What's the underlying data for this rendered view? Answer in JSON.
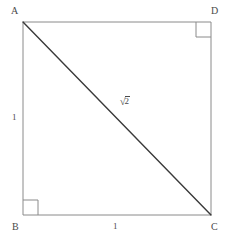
{
  "figure": {
    "kind": "geometry-diagram",
    "canvas": {
      "width": 233,
      "height": 239
    },
    "colors": {
      "background": "#ffffff",
      "square_stroke": "#8a8a8a",
      "diagonal_stroke": "#3a3a3a",
      "right_angle_stroke": "#8a8a8a",
      "label_text": "#4a4a4a"
    },
    "square": {
      "stroke_width": 1,
      "corners": {
        "top_left": {
          "x": 23,
          "y": 22
        },
        "top_right": {
          "x": 211,
          "y": 22
        },
        "bottom_right": {
          "x": 211,
          "y": 215
        },
        "bottom_left": {
          "x": 23,
          "y": 215
        }
      }
    },
    "diagonal": {
      "stroke_width": 1.4,
      "from": {
        "x": 23,
        "y": 22
      },
      "to": {
        "x": 211,
        "y": 215
      }
    },
    "right_angle_markers": [
      {
        "at": "D",
        "x": 196,
        "y": 22,
        "size": 15
      },
      {
        "at": "B",
        "x": 23,
        "y": 200,
        "size": 15
      }
    ],
    "vertex_labels": [
      {
        "id": "A",
        "text": "A"
      },
      {
        "id": "D",
        "text": "D"
      },
      {
        "id": "B",
        "text": "B"
      },
      {
        "id": "C",
        "text": "C"
      }
    ],
    "side_labels": [
      {
        "id": "left",
        "text": "1",
        "side": "AB"
      },
      {
        "id": "bottom",
        "text": "1",
        "side": "BC"
      }
    ],
    "diagonal_label": {
      "radical": "√",
      "radicand": "2",
      "plain_text": "√2",
      "side": "AC"
    }
  }
}
